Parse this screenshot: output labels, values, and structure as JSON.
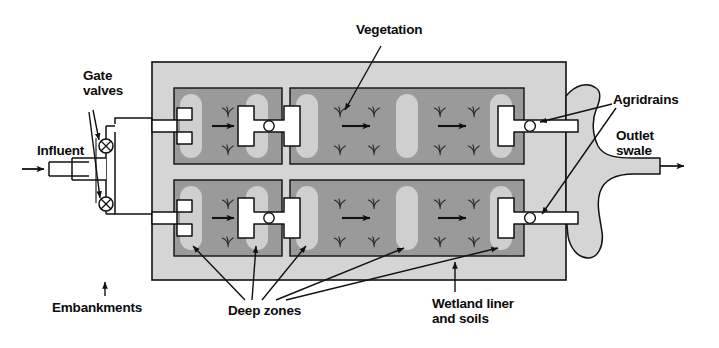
{
  "figure": {
    "kind": "engineering-schematic",
    "labels": {
      "vegetation": "Vegetation",
      "gate_valves": "Gate\nvalves",
      "influent": "Influent",
      "agridrains": "Agridrains",
      "outlet_swale": "Outlet\nswale",
      "embankments": "Embankments",
      "deep_zones": "Deep zones",
      "wetland_liner": "Wetland liner\nand soils"
    },
    "colors": {
      "embankment_fill": "#d5d5d5",
      "cell_fill": "#9a9a9a",
      "deep_zone_fill": "#cfcfcf",
      "structure_fill": "#ffffff",
      "swale_fill": "#d5d5d5",
      "outline": "#111111",
      "text": "#0b0b0b"
    },
    "components": {
      "trains": 2,
      "cells_per_train": 2,
      "forebay_deep_zones_per_cell": 2,
      "main_cell_deep_zones": 3,
      "gate_valve_count": 2,
      "agridrain_count": 2,
      "flow_arrows_per_train": 3,
      "vegetation_symbols_per_main_cell": 8,
      "vegetation_symbols_per_forebay": 2
    },
    "flow": {
      "inlet": "Influent",
      "outlet": "Outlet swale",
      "direction": "left-to-right"
    }
  }
}
